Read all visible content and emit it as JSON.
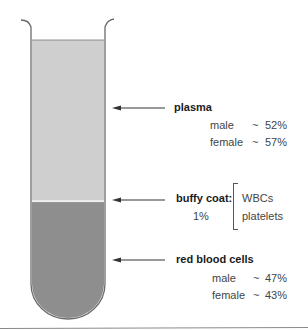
{
  "colors": {
    "plasma": "#cfcfcf",
    "buffy_coat": "#e6e6e6",
    "red_blood_cells": "#8e8e8e",
    "outline": "#6a6a6a",
    "separator": "#8a8a8a"
  },
  "layers": {
    "plasma": {
      "title": "plasma",
      "rows": [
        {
          "sex": "male",
          "tilde": "~",
          "value": "52%"
        },
        {
          "sex": "female",
          "tilde": "~",
          "value": "57%"
        }
      ]
    },
    "buffy_coat": {
      "title": "buffy coat:",
      "percent": "1%",
      "components": [
        "WBCs",
        "platelets"
      ]
    },
    "red_blood_cells": {
      "title": "red blood cells",
      "rows": [
        {
          "sex": "male",
          "tilde": "~",
          "value": "47%"
        },
        {
          "sex": "female",
          "tilde": "~",
          "value": "43%"
        }
      ]
    }
  }
}
